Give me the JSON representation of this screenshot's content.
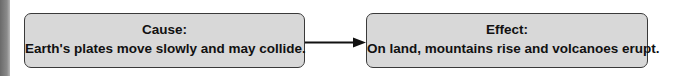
{
  "diagram": {
    "type": "cause-effect",
    "cause": {
      "title": "Cause:",
      "text": "Earth's plates move slowly and may collide."
    },
    "effect": {
      "title": "Effect:",
      "text": "On land, mountains rise and volcanoes erupt."
    },
    "connector": "arrow-right",
    "colors": {
      "box_fill": "#d8d8d8",
      "box_border": "#3a3a3a",
      "text": "#111111",
      "arrow": "#111111"
    }
  }
}
